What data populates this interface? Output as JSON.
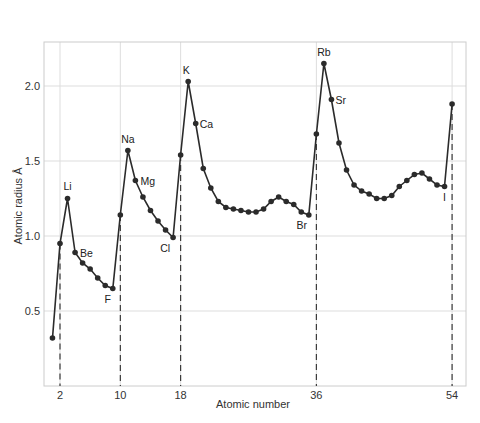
{
  "chart_data": {
    "type": "line",
    "title": "",
    "xlabel": "Atomic number",
    "ylabel": "Atomic radius Å",
    "xlim": [
      0.2,
      56
    ],
    "ylim": [
      0.0,
      2.3
    ],
    "grid": true,
    "legend": "none",
    "x_ticks": [
      2,
      10,
      18,
      36,
      54
    ],
    "y_ticks": [
      0.5,
      1.0,
      1.5,
      2.0
    ],
    "y_tick_labels": [
      "0.5",
      "1.0",
      "1.5",
      "2.0"
    ],
    "x_tick_labels": [
      "2",
      "10",
      "18",
      "36",
      "54"
    ],
    "noble_gas_dashed_lines": [
      2,
      10,
      18,
      36,
      54
    ],
    "series": [
      {
        "name": "Atomic radius",
        "x": [
          1,
          2,
          3,
          4,
          5,
          6,
          7,
          8,
          9,
          10,
          11,
          12,
          13,
          14,
          15,
          16,
          17,
          18,
          19,
          20,
          21,
          22,
          23,
          24,
          25,
          26,
          27,
          28,
          29,
          30,
          31,
          32,
          33,
          34,
          35,
          36,
          37,
          38,
          39,
          40,
          41,
          42,
          43,
          44,
          45,
          46,
          47,
          48,
          49,
          50,
          51,
          52,
          53,
          54
        ],
        "values": [
          0.32,
          0.95,
          1.25,
          0.89,
          0.82,
          0.78,
          0.72,
          0.67,
          0.65,
          1.14,
          1.57,
          1.37,
          1.26,
          1.17,
          1.1,
          1.04,
          0.99,
          1.54,
          2.03,
          1.75,
          1.45,
          1.32,
          1.23,
          1.19,
          1.18,
          1.17,
          1.16,
          1.16,
          1.18,
          1.23,
          1.26,
          1.23,
          1.21,
          1.16,
          1.14,
          1.68,
          2.15,
          1.91,
          1.62,
          1.44,
          1.34,
          1.3,
          1.28,
          1.25,
          1.25,
          1.27,
          1.33,
          1.37,
          1.41,
          1.42,
          1.38,
          1.34,
          1.33,
          1.88
        ]
      }
    ],
    "annotations": [
      {
        "text": "Li",
        "x": 3
      },
      {
        "text": "Be",
        "x": 4
      },
      {
        "text": "F",
        "x": 9
      },
      {
        "text": "Na",
        "x": 11
      },
      {
        "text": "Mg",
        "x": 12
      },
      {
        "text": "Cl",
        "x": 17
      },
      {
        "text": "K",
        "x": 19
      },
      {
        "text": "Ca",
        "x": 20
      },
      {
        "text": "Br",
        "x": 35
      },
      {
        "text": "Rb",
        "x": 37
      },
      {
        "text": "Sr",
        "x": 38
      },
      {
        "text": "I",
        "x": 53
      }
    ]
  },
  "colors": {
    "line": "#2b2b2b",
    "grid": "#dddddd",
    "frame": "#cccccc",
    "text": "#333333"
  }
}
